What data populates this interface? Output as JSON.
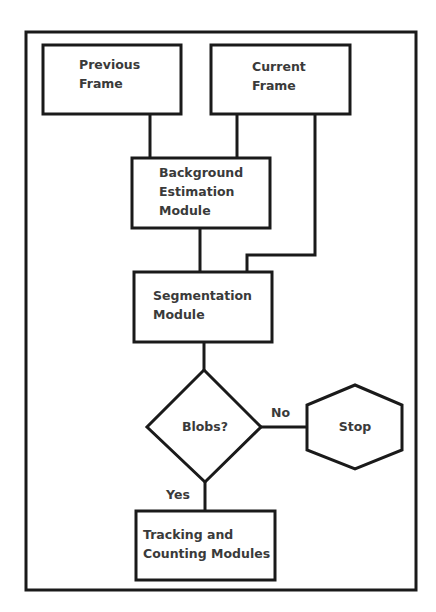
{
  "diagram": {
    "type": "flowchart",
    "nodes": [
      {
        "id": "previous_frame",
        "shape": "rectangle",
        "lines": [
          "Previous",
          "Frame"
        ]
      },
      {
        "id": "current_frame",
        "shape": "rectangle",
        "lines": [
          "Current",
          "Frame"
        ]
      },
      {
        "id": "background_estimation",
        "shape": "rectangle",
        "lines": [
          "Background",
          "Estimation",
          "Module"
        ]
      },
      {
        "id": "segmentation",
        "shape": "rectangle",
        "lines": [
          "Segmentation",
          "Module"
        ]
      },
      {
        "id": "blobs",
        "shape": "diamond",
        "lines": [
          "Blobs?"
        ]
      },
      {
        "id": "stop",
        "shape": "hexagon",
        "lines": [
          "Stop"
        ]
      },
      {
        "id": "tracking_counting",
        "shape": "rectangle",
        "lines": [
          "Tracking and",
          "Counting Modules"
        ]
      }
    ],
    "edges": [
      {
        "from": "previous_frame",
        "to": "background_estimation",
        "label": ""
      },
      {
        "from": "current_frame",
        "to": "background_estimation",
        "label": ""
      },
      {
        "from": "current_frame",
        "to": "segmentation",
        "label": ""
      },
      {
        "from": "background_estimation",
        "to": "segmentation",
        "label": ""
      },
      {
        "from": "segmentation",
        "to": "blobs",
        "label": ""
      },
      {
        "from": "blobs",
        "to": "stop",
        "label": "No"
      },
      {
        "from": "blobs",
        "to": "tracking_counting",
        "label": "Yes"
      }
    ],
    "edge_labels": {
      "no": "No",
      "yes": "Yes"
    },
    "colors": {
      "stroke": "#1a1a1a",
      "text": "#3a3a3a",
      "background": "#ffffff"
    }
  }
}
